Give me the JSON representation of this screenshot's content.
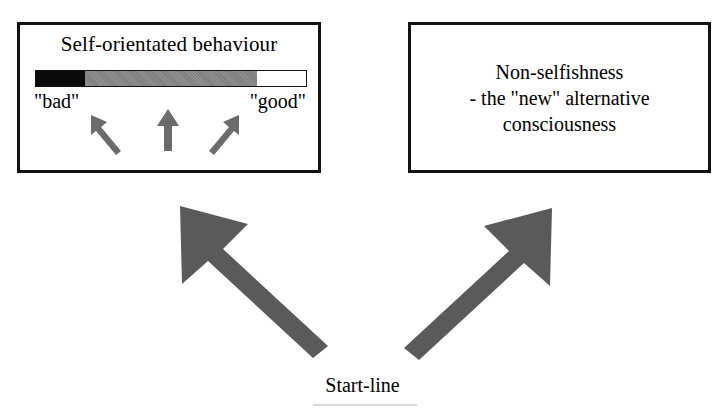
{
  "diagram": {
    "title_text": "",
    "left_box": {
      "title": "Self-orientated behaviour",
      "scale": {
        "bad_label": "\"bad\"",
        "good_label": "\"good\"",
        "segments": [
          {
            "name": "bad",
            "color": "#0b0b0b",
            "percent": 18
          },
          {
            "name": "middle",
            "color": "#7d7d7d",
            "percent": 64
          },
          {
            "name": "good",
            "color": "#ffffff",
            "percent": 18
          }
        ]
      },
      "mini_arrows": [
        {
          "name": "arrow-up-left",
          "direction": "up-left"
        },
        {
          "name": "arrow-up",
          "direction": "up"
        },
        {
          "name": "arrow-up-right",
          "direction": "up-right"
        }
      ]
    },
    "right_box": {
      "lines": [
        "Non-selfishness",
        "- the \"new\" alternative",
        "consciousness"
      ]
    },
    "big_arrows": [
      {
        "name": "arrow-to-left-box",
        "direction": "up-left"
      },
      {
        "name": "arrow-to-right-box",
        "direction": "up-right"
      }
    ],
    "start_line": {
      "label": "Start-line"
    },
    "colors": {
      "stroke": "#111111",
      "arrow_fill": "#5a5a5a",
      "mini_arrow_fill": "#6b6b6b",
      "background": "#ffffff"
    }
  }
}
